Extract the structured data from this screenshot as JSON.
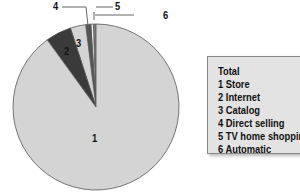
{
  "chart_data": {
    "type": "pie",
    "title": "",
    "legend_title": "Total",
    "legend_position": "right",
    "categories": [
      "Store",
      "Internet",
      "Catalog",
      "Direct selling",
      "TV home shopping",
      "Automatic"
    ],
    "labels": [
      "1",
      "2",
      "3",
      "4",
      "5",
      "6"
    ],
    "values": [
      90.0,
      5.0,
      3.0,
      1.0,
      0.5,
      0.5
    ],
    "colors": [
      "#d4d4d4",
      "#3a3a3a",
      "#d4d4d4",
      "#555555",
      "#f0f0f0",
      "#888888"
    ]
  },
  "legend": {
    "title": "Total",
    "items": [
      "1 Store",
      "2 Internet",
      "3 Catalog",
      "4 Direct selling",
      "5 TV home shopping",
      "6 Automatic"
    ]
  },
  "slice_labels": {
    "s1": "1",
    "s2": "2",
    "s3": "3",
    "s4": "4",
    "s5": "5",
    "s6": "6"
  }
}
